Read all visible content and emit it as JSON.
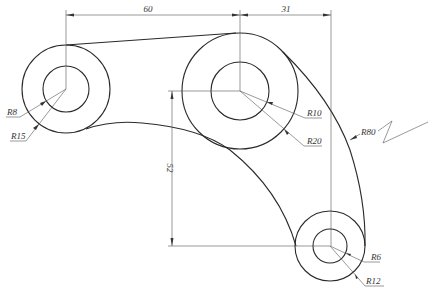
{
  "drawing": {
    "title": "Link arm with three bosses",
    "dimensions": {
      "horizontal_left": "60",
      "horizontal_right": "31",
      "vertical": "52"
    },
    "radii_labels": {
      "left_inner": "R8",
      "left_outer": "R15",
      "middle_inner": "R10",
      "middle_outer": "R20",
      "bottom_inner": "R6",
      "bottom_outer": "R12",
      "outer_arc": "R80"
    }
  }
}
